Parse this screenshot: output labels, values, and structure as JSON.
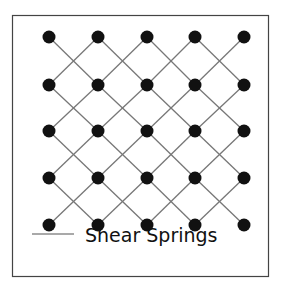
{
  "diagram": {
    "type": "lattice",
    "grid": {
      "rows": 5,
      "cols": 5,
      "x": [
        49,
        98,
        147,
        195,
        244
      ],
      "y": [
        37,
        85,
        131,
        178,
        225
      ]
    },
    "node_color": "#111111",
    "spring_color": "#777777",
    "frame": {
      "x": 12,
      "y": 15,
      "w": 257,
      "h": 262
    }
  },
  "legend": {
    "label": "Shear Springs"
  }
}
